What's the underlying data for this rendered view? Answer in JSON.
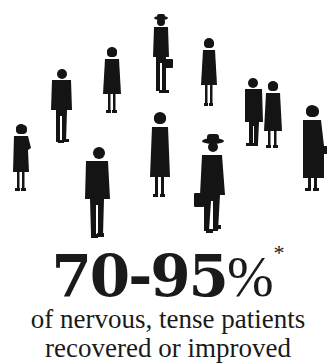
{
  "headline": {
    "value": "70-95",
    "percent_sign": "%",
    "footnote_marker": "*"
  },
  "caption": {
    "line1": "of nervous, tense patients",
    "line2_partial": "recovered or improved"
  },
  "illustration": {
    "description": "Silhouettes of eleven standing people scattered across white background",
    "figure_count": 11,
    "fill_color": "#141414",
    "background_color": "#ffffff"
  }
}
